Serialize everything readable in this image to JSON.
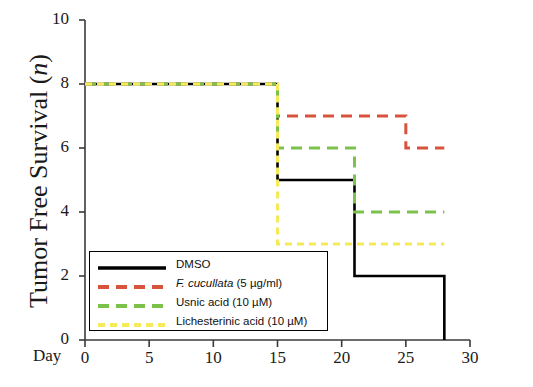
{
  "chart_data": {
    "type": "line",
    "title": "",
    "xlabel": "Day",
    "ylabel": "Tumor Free Survival (n)",
    "ylabel_parts": {
      "text": "Tumor Free Survival (",
      "italic": "n",
      "tail": ")"
    },
    "xlim": [
      0,
      30
    ],
    "ylim": [
      0,
      10
    ],
    "xticks": [
      0,
      5,
      10,
      15,
      20,
      25,
      30
    ],
    "yticks": [
      0,
      2,
      4,
      6,
      8,
      10
    ],
    "xtick_labels": [
      "0",
      "5",
      "10",
      "15",
      "20",
      "25",
      "30"
    ],
    "ytick_labels": [
      "0",
      "2",
      "4",
      "6",
      "8",
      "10"
    ],
    "grid": false,
    "legend_position": "lower-left-inside",
    "step_style": "post",
    "series": [
      {
        "name": "DMSO",
        "color": "#000000",
        "dash": "solid",
        "x": [
          0,
          15,
          21,
          28,
          28
        ],
        "y": [
          8,
          5,
          2,
          2,
          0
        ]
      },
      {
        "name": "F. cucullata (5 µg/ml)",
        "name_italic": "F. cucullata",
        "name_rest": " (5 µg/ml)",
        "color": "#d9533c",
        "dash": "dashed",
        "x": [
          0,
          15,
          25,
          28
        ],
        "y": [
          8,
          7,
          6,
          6
        ]
      },
      {
        "name": "Usnic acid (10 µM)",
        "color": "#7cc24a",
        "dash": "dashed",
        "x": [
          0,
          15,
          21,
          28
        ],
        "y": [
          8,
          6,
          4,
          4
        ]
      },
      {
        "name": "Lichesterinic acid (10 µM)",
        "color": "#f4ea5a",
        "dash": "dashed",
        "x": [
          0,
          15,
          28
        ],
        "y": [
          8,
          3,
          3
        ]
      }
    ]
  },
  "axis": {
    "day_label": "Day"
  },
  "legend": {
    "items": [
      {
        "label": "DMSO"
      },
      {
        "label": "F. cucullata (5 µg/ml)"
      },
      {
        "label": "Usnic acid (10 µM)"
      },
      {
        "label": "Lichesterinic acid (10 µM)"
      }
    ]
  }
}
